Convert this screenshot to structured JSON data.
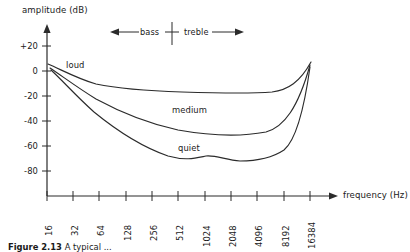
{
  "figure": {
    "caption_prefix": "Figure 2.13",
    "caption_text": "A typical ...",
    "ylabel": "amplitude (dB)",
    "xlabel": "frequency (Hz)"
  },
  "annotations": {
    "bass_label": "bass",
    "treble_label": "treble",
    "left_arrow_icon": "arrow-left-icon",
    "right_arrow_icon": "arrow-right-icon",
    "divider_icon": "vertical-divider-icon",
    "x_axis_arrow_icon": "arrow-right-icon",
    "y_axis_arrow_icon": "arrow-up-icon"
  },
  "curve_labels": {
    "loud": "loud",
    "medium": "medium",
    "quiet": "quiet"
  },
  "chart_data": {
    "type": "line",
    "title": "",
    "subtitle": "",
    "xlabel": "frequency (Hz)",
    "ylabel": "amplitude (dB)",
    "xscale": "log2",
    "grid": false,
    "legend": "inline-labels",
    "xlim": [
      16,
      16384
    ],
    "ylim": [
      -90,
      28
    ],
    "xticks": [
      16,
      32,
      64,
      128,
      256,
      512,
      1024,
      2048,
      4096,
      8192,
      16384
    ],
    "xtick_labels": [
      "16",
      "32",
      "64",
      "128",
      "256",
      "512",
      "1024",
      "2048",
      "4096",
      "8192",
      "16384"
    ],
    "yticks": [
      20,
      0,
      -20,
      -40,
      -60,
      -80
    ],
    "ytick_labels": [
      "+20",
      "0",
      "-20",
      "-40",
      "-60",
      "-80"
    ],
    "x": [
      16,
      32,
      64,
      128,
      256,
      512,
      1024,
      2048,
      4096,
      8192,
      16384
    ],
    "series": [
      {
        "name": "loud",
        "values": [
          4,
          -5,
          -11,
          -14,
          -16,
          -17,
          -18,
          -19,
          -20,
          -18,
          2
        ]
      },
      {
        "name": "medium",
        "values": [
          3,
          -9,
          -20,
          -28,
          -34,
          -39,
          -43,
          -45,
          -45,
          -40,
          1
        ]
      },
      {
        "name": "quiet",
        "values": [
          2,
          -14,
          -29,
          -42,
          -53,
          -61,
          -67,
          -70,
          -68,
          -70,
          0
        ]
      }
    ],
    "annotations": [
      {
        "text": "bass",
        "arrow": "left",
        "y_dB": 24
      },
      {
        "text": "treble",
        "arrow": "right",
        "y_dB": 24
      }
    ]
  },
  "ytick_positions": [
    {
      "label": "+20",
      "y": 46
    },
    {
      "label": "0",
      "y": 71
    },
    {
      "label": "-20",
      "y": 96
    },
    {
      "label": "-40",
      "y": 121
    },
    {
      "label": "-60",
      "y": 146
    },
    {
      "label": "-80",
      "y": 171
    }
  ],
  "xtick_positions": [
    {
      "label": "16",
      "x": 47
    },
    {
      "label": "32",
      "x": 73
    },
    {
      "label": "64",
      "x": 99
    },
    {
      "label": "128",
      "x": 126
    },
    {
      "label": "256",
      "x": 152
    },
    {
      "label": "512",
      "x": 178
    },
    {
      "label": "1024",
      "x": 205
    },
    {
      "label": "2048",
      "x": 231
    },
    {
      "label": "4096",
      "x": 257
    },
    {
      "label": "8192",
      "x": 284
    },
    {
      "label": "16384",
      "x": 310
    }
  ],
  "paths": {
    "loud": "M 48,64 C 62,70 78,79 96,84 C 120,89 150,91 182,92 C 214,93 248,94 272,92 C 288,90 300,82 311,62",
    "medium": "M 50,68 C 62,76 78,88 96,99 C 120,112 150,124 178,130 C 206,135 240,137 266,132 C 284,127 298,108 310,65",
    "quiet": "M 51,70 C 62,80 76,96 94,112 C 116,130 142,147 168,156 C 186,161 196,158 206,156 C 216,155 226,160 240,161 C 256,161 272,158 284,150 C 296,140 304,110 310,67"
  }
}
